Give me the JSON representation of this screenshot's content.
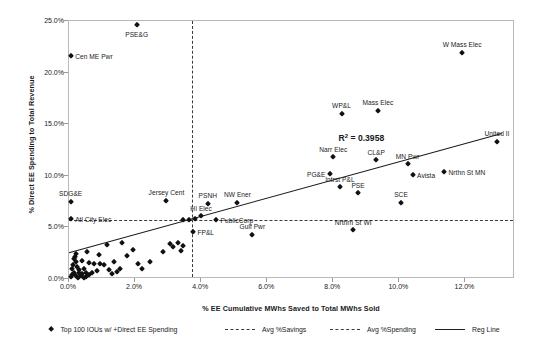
{
  "chart_data": {
    "type": "scatter",
    "title": "",
    "xlabel": "% EE Cumulative MWhs Saved to Total MWhs Sold",
    "ylabel": "% Direct EE Spending to Total Revenue",
    "xlim": [
      0.0,
      13.5
    ],
    "ylim": [
      0.0,
      25.0
    ],
    "xticks": [
      "0.0%",
      "2.0%",
      "4.0%",
      "6.0%",
      "8.0%",
      "10.0%",
      "12.0%"
    ],
    "xtick_values": [
      0.0,
      2.0,
      4.0,
      6.0,
      8.0,
      10.0,
      12.0
    ],
    "yticks": [
      "0.0%",
      "5.0%",
      "10.0%",
      "15.0%",
      "20.0%",
      "25.0%"
    ],
    "ytick_values": [
      0.0,
      5.0,
      10.0,
      15.0,
      20.0,
      25.0
    ],
    "grid": false,
    "legend_position": "bottom",
    "annotations": [
      {
        "text": "R² = 0.3958",
        "x": 8.85,
        "y": 13.7
      }
    ],
    "reference_lines": [
      {
        "name": "Avg %Savings",
        "orientation": "vertical",
        "value": 3.72,
        "style": "dashed"
      },
      {
        "name": "Avg %Spending",
        "orientation": "horizontal",
        "value": 5.75,
        "style": "dashed"
      }
    ],
    "regression": {
      "name": "Reg Line",
      "style": "solid",
      "r_squared": 0.3958,
      "x_start": 0.0,
      "y_start": 2.55,
      "x_end": 13.1,
      "y_end": 14.1
    },
    "series": [
      {
        "name": "Top 100 IOUs w/ +Direct EE Spending",
        "marker": "diamond",
        "color": "#111111",
        "points": [
          {
            "x": 2.05,
            "y": 24.6,
            "label": "PSE&G",
            "label_pos": "below"
          },
          {
            "x": 0.05,
            "y": 21.6,
            "label": "Cen ME Pwr",
            "label_pos": "right"
          },
          {
            "x": 11.9,
            "y": 21.9,
            "label": "W Mass Elec",
            "label_pos": "above"
          },
          {
            "x": 8.25,
            "y": 16.0,
            "label": "WP&L",
            "label_pos": "above"
          },
          {
            "x": 9.35,
            "y": 16.3,
            "label": "Mass Elec",
            "label_pos": "above"
          },
          {
            "x": 12.95,
            "y": 13.3,
            "label": "United Il",
            "label_pos": "above"
          },
          {
            "x": 8.0,
            "y": 11.8,
            "label": "Narr Elec",
            "label_pos": "above"
          },
          {
            "x": 9.3,
            "y": 11.5,
            "label": "CL&P",
            "label_pos": "above"
          },
          {
            "x": 10.25,
            "y": 11.1,
            "label": "MN Pwr",
            "label_pos": "above"
          },
          {
            "x": 7.9,
            "y": 10.2,
            "label": "PG&E",
            "label_pos": "left"
          },
          {
            "x": 10.4,
            "y": 10.1,
            "label": "Avista",
            "label_pos": "right"
          },
          {
            "x": 11.35,
            "y": 10.4,
            "label": "Nrthn St MN",
            "label_pos": "right"
          },
          {
            "x": 8.2,
            "y": 8.9,
            "label": "Intrst P&L",
            "label_pos": "above"
          },
          {
            "x": 8.75,
            "y": 8.3,
            "label": "PSE",
            "label_pos": "above"
          },
          {
            "x": 10.05,
            "y": 7.4,
            "label": "SCE",
            "label_pos": "above"
          },
          {
            "x": 8.6,
            "y": 4.7,
            "label": "Nrthrn St WI",
            "label_pos": "above"
          },
          {
            "x": 0.05,
            "y": 7.5,
            "label": "SDG&E",
            "label_pos": "above"
          },
          {
            "x": 0.05,
            "y": 5.85,
            "label": "Atl City Elec",
            "label_pos": "right"
          },
          {
            "x": 2.95,
            "y": 7.6,
            "label": "Jersey Cent",
            "label_pos": "above"
          },
          {
            "x": 4.2,
            "y": 7.3,
            "label": "PSNH",
            "label_pos": "above"
          },
          {
            "x": 5.1,
            "y": 7.4,
            "label": "NW Ener",
            "label_pos": "above"
          },
          {
            "x": 4.0,
            "y": 6.1,
            "label": "HI Elec",
            "label_pos": "above"
          },
          {
            "x": 4.45,
            "y": 5.7,
            "label": "PublicCorp",
            "label_pos": "right"
          },
          {
            "x": 3.75,
            "y": 4.6,
            "label": "FP&L",
            "label_pos": "right"
          },
          {
            "x": 5.55,
            "y": 4.3,
            "label": "Gulf Pwr",
            "label_pos": "above"
          },
          {
            "x": 3.45,
            "y": 5.7,
            "label": "",
            "label_pos": ""
          },
          {
            "x": 3.62,
            "y": 5.75,
            "label": "",
            "label_pos": ""
          },
          {
            "x": 3.8,
            "y": 5.8,
            "label": "",
            "label_pos": ""
          },
          {
            "x": 1.15,
            "y": 3.3,
            "label": "",
            "label_pos": ""
          },
          {
            "x": 1.6,
            "y": 3.45,
            "label": "",
            "label_pos": ""
          },
          {
            "x": 1.95,
            "y": 2.85,
            "label": "",
            "label_pos": ""
          },
          {
            "x": 1.75,
            "y": 2.25,
            "label": "",
            "label_pos": ""
          },
          {
            "x": 2.45,
            "y": 1.6,
            "label": "",
            "label_pos": ""
          },
          {
            "x": 2.85,
            "y": 2.6,
            "label": "",
            "label_pos": ""
          },
          {
            "x": 3.05,
            "y": 3.4,
            "label": "",
            "label_pos": ""
          },
          {
            "x": 3.15,
            "y": 3.1,
            "label": "",
            "label_pos": ""
          },
          {
            "x": 3.3,
            "y": 3.5,
            "label": "",
            "label_pos": ""
          },
          {
            "x": 3.4,
            "y": 2.75,
            "label": "",
            "label_pos": ""
          },
          {
            "x": 3.45,
            "y": 3.2,
            "label": "",
            "label_pos": ""
          },
          {
            "x": 1.35,
            "y": 1.65,
            "label": "",
            "label_pos": ""
          },
          {
            "x": 2.1,
            "y": 1.5,
            "label": "",
            "label_pos": ""
          },
          {
            "x": 0.6,
            "y": 1.55,
            "label": "",
            "label_pos": ""
          },
          {
            "x": 0.75,
            "y": 1.45,
            "label": "",
            "label_pos": ""
          },
          {
            "x": 0.95,
            "y": 1.5,
            "label": "",
            "label_pos": ""
          },
          {
            "x": 1.05,
            "y": 1.35,
            "label": "",
            "label_pos": ""
          },
          {
            "x": 0.45,
            "y": 1.0,
            "label": "",
            "label_pos": ""
          },
          {
            "x": 0.3,
            "y": 0.85,
            "label": "",
            "label_pos": ""
          },
          {
            "x": 0.2,
            "y": 2.45,
            "label": "",
            "label_pos": ""
          },
          {
            "x": 0.18,
            "y": 2.15,
            "label": "",
            "label_pos": ""
          },
          {
            "x": 0.15,
            "y": 1.9,
            "label": "",
            "label_pos": ""
          },
          {
            "x": 0.22,
            "y": 1.65,
            "label": "",
            "label_pos": ""
          },
          {
            "x": 0.12,
            "y": 1.4,
            "label": "",
            "label_pos": ""
          },
          {
            "x": 0.25,
            "y": 1.2,
            "label": "",
            "label_pos": ""
          },
          {
            "x": 0.1,
            "y": 1.0,
            "label": "",
            "label_pos": ""
          },
          {
            "x": 0.3,
            "y": 0.6,
            "label": "",
            "label_pos": ""
          },
          {
            "x": 0.15,
            "y": 0.55,
            "label": "",
            "label_pos": ""
          },
          {
            "x": 0.08,
            "y": 0.35,
            "label": "",
            "label_pos": ""
          },
          {
            "x": 0.2,
            "y": 0.3,
            "label": "",
            "label_pos": ""
          },
          {
            "x": 0.35,
            "y": 0.25,
            "label": "",
            "label_pos": ""
          },
          {
            "x": 0.5,
            "y": 0.2,
            "label": "",
            "label_pos": ""
          },
          {
            "x": 0.62,
            "y": 0.35,
            "label": "",
            "label_pos": ""
          },
          {
            "x": 0.05,
            "y": 0.15,
            "label": "",
            "label_pos": ""
          },
          {
            "x": 0.28,
            "y": 0.05,
            "label": "",
            "label_pos": ""
          },
          {
            "x": 0.45,
            "y": 0.08,
            "label": "",
            "label_pos": ""
          },
          {
            "x": 0.7,
            "y": 0.6,
            "label": "",
            "label_pos": ""
          },
          {
            "x": 0.85,
            "y": 0.75,
            "label": "",
            "label_pos": ""
          },
          {
            "x": 1.2,
            "y": 0.85,
            "label": "",
            "label_pos": ""
          },
          {
            "x": 1.45,
            "y": 0.7,
            "label": "",
            "label_pos": ""
          },
          {
            "x": 1.55,
            "y": 0.95,
            "label": "",
            "label_pos": ""
          },
          {
            "x": 0.55,
            "y": 2.6,
            "label": "",
            "label_pos": ""
          },
          {
            "x": 0.9,
            "y": 2.3,
            "label": "",
            "label_pos": ""
          },
          {
            "x": 1.3,
            "y": 0.45,
            "label": "",
            "label_pos": ""
          },
          {
            "x": 2.2,
            "y": 0.95,
            "label": "",
            "label_pos": ""
          },
          {
            "x": 0.4,
            "y": 1.75,
            "label": "",
            "label_pos": ""
          },
          {
            "x": 0.38,
            "y": 0.45,
            "label": "",
            "label_pos": ""
          },
          {
            "x": 0.52,
            "y": 0.55,
            "label": "",
            "label_pos": ""
          }
        ]
      }
    ],
    "legend": [
      {
        "label": "Top 100 IOUs w/ +Direct EE Spending",
        "marker": "diamond"
      },
      {
        "label": "Avg %Savings",
        "marker": "dashed-line"
      },
      {
        "label": "Avg %Spending",
        "marker": "dashed-line"
      },
      {
        "label": "Reg Line",
        "marker": "solid-line"
      }
    ]
  }
}
